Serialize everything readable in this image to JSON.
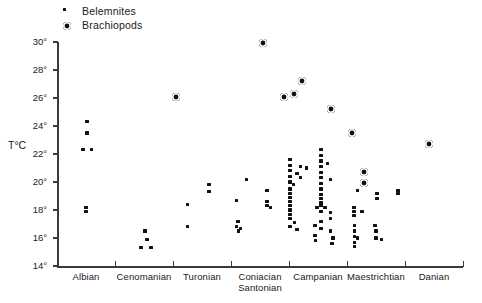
{
  "legend": {
    "items": [
      {
        "label": "Belemnites",
        "marker": "belemnite-dot-icon"
      },
      {
        "label": "Brachiopods",
        "marker": "brachiopod-circle-icon"
      }
    ]
  },
  "chart_data": {
    "type": "scatter",
    "title": "",
    "xlabel": "",
    "ylabel": "T°C",
    "ylim": [
      14,
      30
    ],
    "ytick_step": 2,
    "ytick_labels": [
      "30°",
      "28°",
      "26°",
      "24°",
      "22°",
      "20°",
      "18°",
      "16°",
      "14°"
    ],
    "grid": false,
    "legend_position": "top-left",
    "categories": [
      {
        "label": "Albian",
        "lines": [
          "Albian"
        ]
      },
      {
        "label": "Cenomanian",
        "lines": [
          "Cenomanian"
        ]
      },
      {
        "label": "Turonian",
        "lines": [
          "Turonian"
        ]
      },
      {
        "label": "Coniacian Santonian",
        "lines": [
          "Coniacian",
          "Santonian"
        ]
      },
      {
        "label": "Campanian",
        "lines": [
          "Campanian"
        ]
      },
      {
        "label": "Maestrichtian",
        "lines": [
          "Maestrichtian"
        ]
      },
      {
        "label": "Danian",
        "lines": [
          "Danian"
        ]
      }
    ],
    "series": [
      {
        "name": "Belemnites",
        "points": [
          {
            "x": 0.52,
            "y": 24.3
          },
          {
            "x": 0.52,
            "y": 23.5
          },
          {
            "x": 0.45,
            "y": 22.3
          },
          {
            "x": 0.6,
            "y": 22.3
          },
          {
            "x": 0.5,
            "y": 18.2
          },
          {
            "x": 0.5,
            "y": 17.9
          },
          {
            "x": 1.52,
            "y": 16.5
          },
          {
            "x": 1.55,
            "y": 15.9
          },
          {
            "x": 1.45,
            "y": 15.3
          },
          {
            "x": 1.62,
            "y": 15.3
          },
          {
            "x": 2.62,
            "y": 19.8
          },
          {
            "x": 2.62,
            "y": 19.3
          },
          {
            "x": 2.25,
            "y": 18.4
          },
          {
            "x": 2.25,
            "y": 16.8
          },
          {
            "x": 3.27,
            "y": 20.2
          },
          {
            "x": 3.62,
            "y": 19.4
          },
          {
            "x": 3.1,
            "y": 18.7
          },
          {
            "x": 3.62,
            "y": 18.6
          },
          {
            "x": 3.62,
            "y": 18.3
          },
          {
            "x": 3.68,
            "y": 18.2
          },
          {
            "x": 3.12,
            "y": 17.2
          },
          {
            "x": 3.1,
            "y": 16.8
          },
          {
            "x": 3.16,
            "y": 16.7
          },
          {
            "x": 3.13,
            "y": 16.5
          },
          {
            "x": 4.02,
            "y": 21.6
          },
          {
            "x": 4.02,
            "y": 21.2
          },
          {
            "x": 4.2,
            "y": 21.1
          },
          {
            "x": 4.3,
            "y": 21.0
          },
          {
            "x": 4.02,
            "y": 20.8
          },
          {
            "x": 4.14,
            "y": 20.6
          },
          {
            "x": 4.02,
            "y": 20.4
          },
          {
            "x": 4.2,
            "y": 20.3
          },
          {
            "x": 4.02,
            "y": 20.0
          },
          {
            "x": 4.08,
            "y": 19.8
          },
          {
            "x": 4.02,
            "y": 19.5
          },
          {
            "x": 4.02,
            "y": 19.2
          },
          {
            "x": 4.02,
            "y": 18.9
          },
          {
            "x": 4.02,
            "y": 18.6
          },
          {
            "x": 4.02,
            "y": 18.3
          },
          {
            "x": 4.02,
            "y": 18.0
          },
          {
            "x": 4.02,
            "y": 17.7
          },
          {
            "x": 4.02,
            "y": 17.4
          },
          {
            "x": 4.1,
            "y": 17.1
          },
          {
            "x": 4.02,
            "y": 16.8
          },
          {
            "x": 4.14,
            "y": 16.6
          },
          {
            "x": 4.55,
            "y": 22.3
          },
          {
            "x": 4.55,
            "y": 21.9
          },
          {
            "x": 4.55,
            "y": 21.5
          },
          {
            "x": 4.66,
            "y": 21.3
          },
          {
            "x": 4.55,
            "y": 21.1
          },
          {
            "x": 4.55,
            "y": 20.7
          },
          {
            "x": 4.55,
            "y": 20.3
          },
          {
            "x": 4.72,
            "y": 20.2
          },
          {
            "x": 4.55,
            "y": 19.9
          },
          {
            "x": 4.55,
            "y": 19.5
          },
          {
            "x": 4.55,
            "y": 19.1
          },
          {
            "x": 4.55,
            "y": 18.8
          },
          {
            "x": 4.55,
            "y": 18.5
          },
          {
            "x": 4.55,
            "y": 18.3
          },
          {
            "x": 4.62,
            "y": 18.2
          },
          {
            "x": 4.48,
            "y": 18.2
          },
          {
            "x": 4.55,
            "y": 17.9
          },
          {
            "x": 4.72,
            "y": 17.8
          },
          {
            "x": 4.72,
            "y": 17.4
          },
          {
            "x": 4.55,
            "y": 17.2
          },
          {
            "x": 4.45,
            "y": 16.9
          },
          {
            "x": 4.55,
            "y": 16.7
          },
          {
            "x": 4.72,
            "y": 16.5
          },
          {
            "x": 4.45,
            "y": 16.2
          },
          {
            "x": 4.76,
            "y": 16.0
          },
          {
            "x": 4.46,
            "y": 15.8
          },
          {
            "x": 4.74,
            "y": 15.6
          },
          {
            "x": 5.18,
            "y": 19.4
          },
          {
            "x": 5.52,
            "y": 19.2
          },
          {
            "x": 5.52,
            "y": 18.8
          },
          {
            "x": 5.12,
            "y": 18.2
          },
          {
            "x": 5.12,
            "y": 17.9
          },
          {
            "x": 5.26,
            "y": 17.9
          },
          {
            "x": 5.12,
            "y": 17.6
          },
          {
            "x": 5.13,
            "y": 16.9
          },
          {
            "x": 5.48,
            "y": 16.9
          },
          {
            "x": 5.13,
            "y": 16.5
          },
          {
            "x": 5.5,
            "y": 16.5
          },
          {
            "x": 5.13,
            "y": 16.1
          },
          {
            "x": 5.18,
            "y": 16.0
          },
          {
            "x": 5.5,
            "y": 16.0
          },
          {
            "x": 5.6,
            "y": 15.9
          },
          {
            "x": 5.13,
            "y": 15.7
          },
          {
            "x": 5.13,
            "y": 15.4
          },
          {
            "x": 5.88,
            "y": 19.4
          },
          {
            "x": 5.88,
            "y": 19.2
          }
        ]
      },
      {
        "name": "Brachiopods",
        "points": [
          {
            "x": 2.05,
            "y": 26.1
          },
          {
            "x": 3.55,
            "y": 29.9
          },
          {
            "x": 3.92,
            "y": 26.1
          },
          {
            "x": 4.08,
            "y": 26.3
          },
          {
            "x": 4.22,
            "y": 27.2
          },
          {
            "x": 4.72,
            "y": 25.2
          },
          {
            "x": 5.08,
            "y": 23.5
          },
          {
            "x": 5.3,
            "y": 20.7
          },
          {
            "x": 5.3,
            "y": 19.9
          },
          {
            "x": 6.42,
            "y": 22.7
          }
        ]
      }
    ]
  }
}
